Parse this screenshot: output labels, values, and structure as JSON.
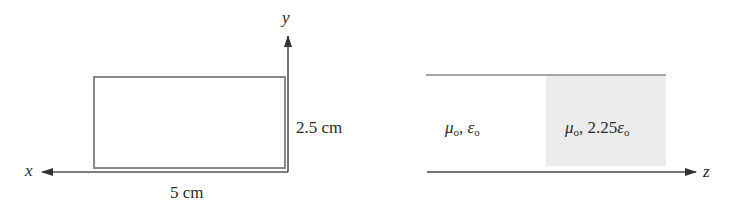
{
  "left_figure": {
    "axis_x_label": "x",
    "axis_y_label": "y",
    "width_label": "5 cm",
    "height_label": "2.5 cm"
  },
  "right_figure": {
    "axis_z_label": "z",
    "region1": {
      "mu": "μ",
      "mu_sub": "o",
      "sep": ",",
      "eps_coef": "",
      "eps": "ε",
      "eps_sub": "o"
    },
    "region2": {
      "mu": "μ",
      "mu_sub": "o",
      "sep": ",",
      "eps_coef": "2.25",
      "eps": "ε",
      "eps_sub": "o"
    }
  },
  "colors": {
    "line": "#8a8a8a",
    "axis": "#333333",
    "dielectric_fill": "#ececec"
  }
}
